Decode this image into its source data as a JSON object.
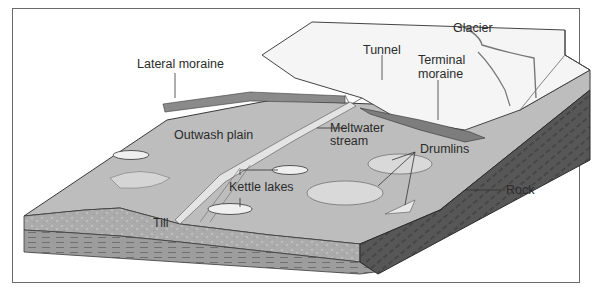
{
  "diagram": {
    "type": "block-diagram",
    "labels": {
      "glacier": "Glacier",
      "tunnel": "Tunnel",
      "lateral_moraine": "Lateral moraine",
      "terminal_moraine_1": "Terminal",
      "terminal_moraine_2": "moraine",
      "outwash_plain": "Outwash plain",
      "meltwater_stream_1": "Meltwater",
      "meltwater_stream_2": "stream",
      "drumlins": "Drumlins",
      "kettle_lakes": "Kettle lakes",
      "rock": "Rock",
      "till": "Till"
    },
    "colors": {
      "surface": "#b9b9b9",
      "ice": "#f4f4f4",
      "till": "#a9a9a9",
      "rock": "#555555",
      "frame": "#6a6a6a",
      "text": "#2b2b2b"
    }
  }
}
